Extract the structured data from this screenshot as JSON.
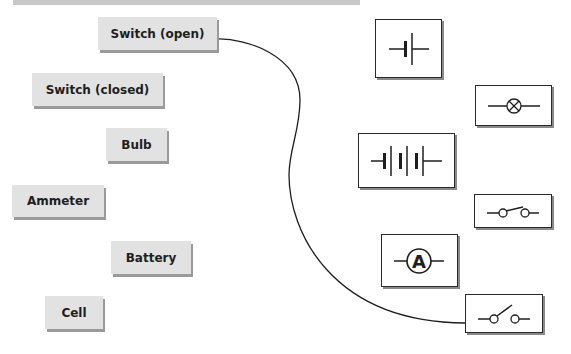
{
  "diagram": {
    "type": "matching-exercise",
    "colors": {
      "label_bg": "#e2e2e2",
      "label_shadow": "#9a9a9a",
      "symbol_border": "#2a2a2a",
      "wire": "#1e1e1e",
      "top_bar": "#c8c8c8"
    },
    "labels": [
      {
        "id": "switch-open",
        "text": "Switch (open)"
      },
      {
        "id": "switch-closed",
        "text": "Switch (closed)"
      },
      {
        "id": "bulb",
        "text": "Bulb"
      },
      {
        "id": "ammeter",
        "text": "Ammeter"
      },
      {
        "id": "battery",
        "text": "Battery"
      },
      {
        "id": "cell",
        "text": "Cell"
      }
    ],
    "symbols": [
      {
        "id": "cell-symbol",
        "icon": "cell-symbol-icon"
      },
      {
        "id": "bulb-symbol",
        "icon": "bulb-symbol-icon"
      },
      {
        "id": "battery-symbol",
        "icon": "battery-symbol-icon"
      },
      {
        "id": "closed-switch-symbol",
        "icon": "closed-switch-symbol-icon"
      },
      {
        "id": "ammeter-symbol",
        "icon": "ammeter-symbol-icon",
        "glyph": "A"
      },
      {
        "id": "open-switch-symbol",
        "icon": "open-switch-symbol-icon"
      }
    ],
    "connections": [
      {
        "from": "Switch (open)",
        "to": "open-switch-symbol"
      }
    ]
  }
}
